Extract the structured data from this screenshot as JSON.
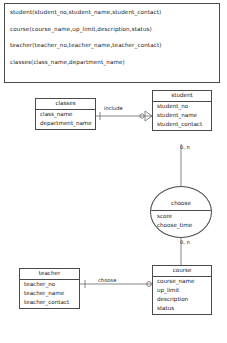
{
  "schema": {
    "relations": [
      "student(student_no,student_name,student_contact)",
      "course(course_name,up_limit,description,status)",
      "teacher(teacher_no,teacher_name,teacher_contact)",
      "classes(class_name,department_name)"
    ]
  },
  "diagram": {
    "type": "er-diagram",
    "entities": [
      {
        "id": "classes",
        "title": "classes",
        "attributes": [
          "class_name",
          "department_name"
        ]
      },
      {
        "id": "student",
        "title": "student",
        "attributes": [
          "student_no",
          "student_name",
          "student_contact"
        ]
      },
      {
        "id": "teacher",
        "title": "teacher",
        "attributes": [
          "teacher_no",
          "teacher_name",
          "teacher_contact"
        ]
      },
      {
        "id": "course",
        "title": "course",
        "attributes": [
          "course_name",
          "up_limit",
          "description",
          "status"
        ]
      }
    ],
    "relationships": [
      {
        "id": "choose",
        "title": "choose",
        "attributes": [
          "score",
          "choose_time"
        ],
        "shape": "ellipse",
        "connects": [
          "student",
          "course"
        ]
      }
    ],
    "edges": [
      {
        "id": "include",
        "label": "include",
        "from": "classes",
        "to": "student",
        "from_marker": "one",
        "to_marker": "crowsfoot-optional"
      },
      {
        "id": "choose-teacher-course",
        "label": "choose",
        "from": "teacher",
        "to": "course",
        "from_marker": "one",
        "to_marker": "zero"
      },
      {
        "id": "student-choose",
        "label": "0, n",
        "from": "student",
        "to": "choose"
      },
      {
        "id": "choose-course",
        "label": "0, n",
        "from": "choose",
        "to": "course"
      }
    ],
    "colors": {
      "stroke": "#4a4a4a",
      "text": "#171717",
      "background": "#ffffff"
    }
  }
}
